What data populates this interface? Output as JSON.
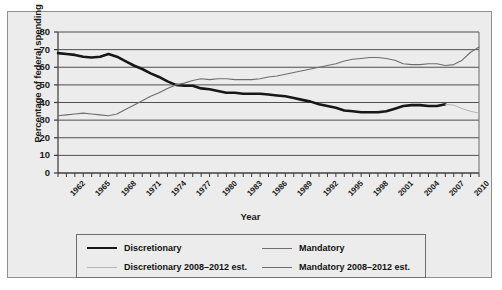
{
  "caption_cut": "truncated text line (illegible, cropped at image top)",
  "chart_data": {
    "type": "line",
    "title": "",
    "xlabel": "Year",
    "ylabel": "Percentage of federal spending",
    "xlim": [
      1962,
      2012
    ],
    "ylim": [
      0,
      80
    ],
    "yticks": [
      0,
      10,
      20,
      30,
      40,
      50,
      60,
      70,
      80
    ],
    "xticks": [
      1962,
      1965,
      1968,
      1971,
      1974,
      1977,
      1980,
      1983,
      1986,
      1989,
      1992,
      1995,
      1998,
      2001,
      2004,
      2007,
      2010
    ],
    "grid": "horizontal",
    "legend_position": "below-plot",
    "x": [
      1962,
      1963,
      1964,
      1965,
      1966,
      1967,
      1968,
      1969,
      1970,
      1971,
      1972,
      1973,
      1974,
      1975,
      1976,
      1977,
      1978,
      1979,
      1980,
      1981,
      1982,
      1983,
      1984,
      1985,
      1986,
      1987,
      1988,
      1989,
      1990,
      1991,
      1992,
      1993,
      1994,
      1995,
      1996,
      1997,
      1998,
      1999,
      2000,
      2001,
      2002,
      2003,
      2004,
      2005,
      2006,
      2007,
      2008,
      2009,
      2010,
      2011,
      2012
    ],
    "series": [
      {
        "name": "Discretionary",
        "color": "#171717",
        "width": 2.6,
        "x_end": 2008,
        "values": [
          68,
          67.5,
          67,
          66,
          65.5,
          66,
          67.5,
          66,
          63.5,
          61,
          59,
          56.5,
          54.5,
          52,
          50,
          49.5,
          49.5,
          48,
          47.5,
          46.5,
          45.5,
          45.5,
          45,
          45,
          45,
          44.5,
          44,
          43.5,
          42.5,
          41.5,
          40.5,
          39,
          38,
          37,
          35.5,
          35,
          34.5,
          34.5,
          34.5,
          35,
          36.5,
          38,
          38.5,
          38.5,
          38,
          38,
          39,
          null,
          null,
          null,
          null
        ]
      },
      {
        "name": "Discretionary 2008–2012 est.",
        "color": "#b4b4b4",
        "width": 1.0,
        "x_start": 2008,
        "values": [
          null,
          null,
          null,
          null,
          null,
          null,
          null,
          null,
          null,
          null,
          null,
          null,
          null,
          null,
          null,
          null,
          null,
          null,
          null,
          null,
          null,
          null,
          null,
          null,
          null,
          null,
          null,
          null,
          null,
          null,
          null,
          null,
          null,
          null,
          null,
          null,
          null,
          null,
          null,
          null,
          null,
          null,
          null,
          null,
          null,
          null,
          39,
          38.5,
          36.5,
          35,
          34
        ]
      },
      {
        "name": "Mandatory",
        "color": "#6e6e6e",
        "width": 1.1,
        "x_end": 2008,
        "values": [
          32.5,
          33,
          33.5,
          34,
          33.5,
          33,
          32.5,
          33.5,
          36,
          38.5,
          41,
          43.5,
          45.5,
          48,
          50,
          51,
          52.5,
          53.5,
          53,
          53.5,
          53.5,
          53,
          53,
          53,
          53.5,
          54.5,
          55,
          56,
          57,
          58,
          59,
          60,
          61,
          62,
          63.5,
          64.5,
          65,
          65.5,
          65.5,
          65,
          64,
          62,
          61.5,
          61.5,
          62,
          62,
          61,
          null,
          null,
          null,
          null
        ]
      },
      {
        "name": "Mandatory 2008–2012 est.",
        "color": "#6e6e6e",
        "width": 1.1,
        "x_start": 2008,
        "values": [
          null,
          null,
          null,
          null,
          null,
          null,
          null,
          null,
          null,
          null,
          null,
          null,
          null,
          null,
          null,
          null,
          null,
          null,
          null,
          null,
          null,
          null,
          null,
          null,
          null,
          null,
          null,
          null,
          null,
          null,
          null,
          null,
          null,
          null,
          null,
          null,
          null,
          null,
          null,
          null,
          null,
          null,
          null,
          null,
          null,
          null,
          61,
          61.5,
          64,
          68.5,
          71.5
        ]
      }
    ]
  },
  "legend": {
    "entries": [
      {
        "label": "Discretionary",
        "key": "disc"
      },
      {
        "label": "Mandatory",
        "key": "mand"
      },
      {
        "label": "Discretionary 2008–2012 est.",
        "key": "disc-est"
      },
      {
        "label": "Mandatory 2008–2012 est.",
        "key": "mand-est"
      }
    ]
  },
  "colors": {
    "plot_background": "#ececec",
    "gridline": "#4f4f4f",
    "frame_border": "#8f8f8f",
    "discretionary": "#171717",
    "mandatory": "#6e6e6e",
    "estimate_light": "#b4b4b4"
  }
}
